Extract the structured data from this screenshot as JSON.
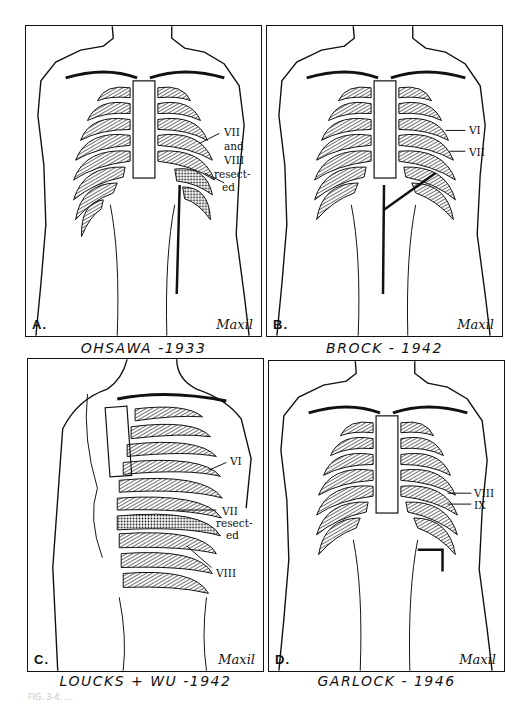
{
  "figure": {
    "panels": [
      {
        "id": "A",
        "letter": "A.",
        "caption": "OHSAWA -1933",
        "signature": "Maxil",
        "labels": [
          "VII",
          "and",
          "VIII",
          "resect-",
          "ed"
        ]
      },
      {
        "id": "B",
        "letter": "B.",
        "caption": "BROCK - 1942",
        "signature": "Maxil",
        "labels": [
          "VI",
          "VII"
        ]
      },
      {
        "id": "C",
        "letter": "C.",
        "caption": "LOUCKS + WU -1942",
        "signature": "Maxil",
        "labels": [
          "VI",
          "VII",
          "resect-",
          "ed",
          "VIII"
        ]
      },
      {
        "id": "D",
        "letter": "D.",
        "caption": "GARLOCK - 1946",
        "signature": "Maxil",
        "labels": [
          "VIII",
          "IX"
        ]
      }
    ],
    "footer_caption": "FIG. 3-4. ..."
  },
  "colors": {
    "ink": "#111111",
    "background": "#ffffff",
    "hatch": "#333333",
    "footer_text": "#c8c8c8"
  }
}
